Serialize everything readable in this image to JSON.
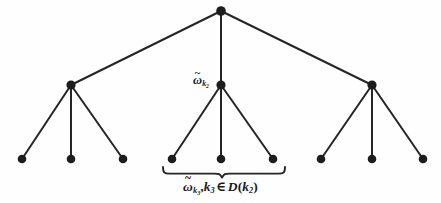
{
  "figure": {
    "background_color": "#fefefe",
    "stroke_color": "#252525",
    "node_fill_color": "#1d1d1d",
    "edge_width_px": 2,
    "node_radius_px": 4.6,
    "width_px": 441,
    "height_px": 203
  },
  "labels": {
    "node_k2": {
      "omega": "ω",
      "tilde": "̃",
      "tilde_glyph": "~",
      "subscript": "k",
      "sub_subscript": "2",
      "plain_text": "ω̃ k₂"
    },
    "brace_caption": {
      "omega": "ω",
      "tilde_glyph": "~",
      "subscript": "k",
      "sub_subscript": "3",
      "comma": ",",
      "k_var": "k",
      "k_index": "3",
      "member_symbol": "∈",
      "set_name": "D",
      "open_paren": "(",
      "set_arg_var": "k",
      "set_arg_index": "2",
      "close_paren": ")",
      "plain_text": "ω̃ k₃ , k₃ ∈ D(k₂)"
    }
  },
  "tree": {
    "root": {
      "id": "root",
      "x": 221,
      "y": 11
    },
    "internal_nodes": [
      {
        "id": "internal-left",
        "x": 71,
        "y": 85
      },
      {
        "id": "internal-middle",
        "x": 221,
        "y": 85
      },
      {
        "id": "internal-right",
        "x": 372,
        "y": 85
      }
    ],
    "leaf_nodes": [
      {
        "id": "leaf-left-1",
        "x": 22,
        "y": 159
      },
      {
        "id": "leaf-left-2",
        "x": 71,
        "y": 159
      },
      {
        "id": "leaf-left-3",
        "x": 123,
        "y": 159
      },
      {
        "id": "leaf-middle-1",
        "x": 172,
        "y": 159
      },
      {
        "id": "leaf-middle-2",
        "x": 221,
        "y": 159
      },
      {
        "id": "leaf-middle-3",
        "x": 273,
        "y": 159
      },
      {
        "id": "leaf-right-1",
        "x": 321,
        "y": 159
      },
      {
        "id": "leaf-right-2",
        "x": 372,
        "y": 159
      },
      {
        "id": "leaf-right-3",
        "x": 423,
        "y": 159
      }
    ],
    "edges": [
      {
        "id": "edge-root-left",
        "x1": 221,
        "y1": 11,
        "x2": 71,
        "y2": 85
      },
      {
        "id": "edge-root-middle",
        "x1": 221,
        "y1": 11,
        "x2": 221,
        "y2": 85
      },
      {
        "id": "edge-root-right",
        "x1": 221,
        "y1": 11,
        "x2": 372,
        "y2": 85
      },
      {
        "id": "edge-left-1",
        "x1": 71,
        "y1": 85,
        "x2": 22,
        "y2": 159
      },
      {
        "id": "edge-left-2",
        "x1": 71,
        "y1": 85,
        "x2": 71,
        "y2": 159
      },
      {
        "id": "edge-left-3",
        "x1": 71,
        "y1": 85,
        "x2": 123,
        "y2": 159
      },
      {
        "id": "edge-middle-1",
        "x1": 221,
        "y1": 85,
        "x2": 172,
        "y2": 159
      },
      {
        "id": "edge-middle-2",
        "x1": 221,
        "y1": 85,
        "x2": 221,
        "y2": 159
      },
      {
        "id": "edge-middle-3",
        "x1": 221,
        "y1": 85,
        "x2": 273,
        "y2": 159
      },
      {
        "id": "edge-right-1",
        "x1": 372,
        "y1": 85,
        "x2": 321,
        "y2": 159
      },
      {
        "id": "edge-right-2",
        "x1": 372,
        "y1": 85,
        "x2": 372,
        "y2": 159
      },
      {
        "id": "edge-right-3",
        "x1": 372,
        "y1": 85,
        "x2": 423,
        "y2": 159
      }
    ],
    "brace": {
      "id": "underbrace-middle-leaves",
      "left_x": 163,
      "right_x": 285,
      "top_y": 167,
      "center_x": 222,
      "tip_y": 177
    }
  }
}
